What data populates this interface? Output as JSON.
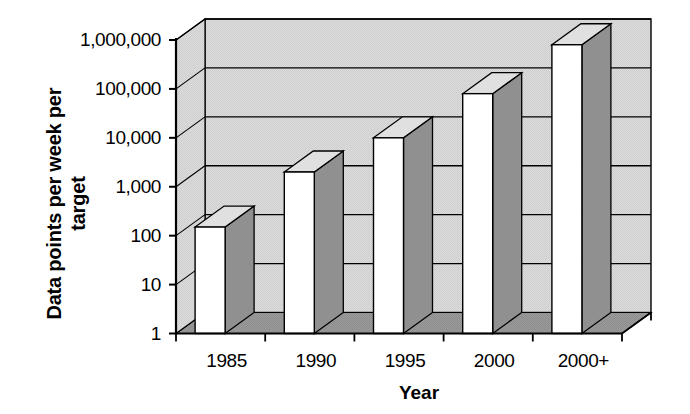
{
  "chart_data": {
    "type": "bar",
    "title": "",
    "subtitle": "",
    "xlabel": "Year",
    "ylabel": "Data points per week per target",
    "ylabel_line1": "Data points per week per",
    "ylabel_line2": "target",
    "categories": [
      "1985",
      "1990",
      "1995",
      "2000",
      "2000+"
    ],
    "values": [
      150,
      2000,
      10000,
      80000,
      800000
    ],
    "yscale": "log",
    "ylim": [
      1,
      1000000
    ],
    "ytick_labels": [
      "1",
      "10",
      "100",
      "1,000",
      "10,000",
      "100,000",
      "1,000,000"
    ],
    "ytick_values": [
      1,
      10,
      100,
      1000,
      10000,
      100000,
      1000000
    ],
    "grid": true,
    "grid_orientation": "horizontal",
    "legend": "none",
    "style": "3d-bar",
    "series": [
      {
        "name": "Data points per week per target",
        "values": [
          150,
          2000,
          10000,
          80000,
          800000
        ]
      }
    ]
  },
  "colors": {
    "bar_front": "#ffffff",
    "bar_side": "#909090",
    "bar_top": "#e0e0e0",
    "back_wall": "#d8d8d8",
    "floor": "#b0b0b0",
    "axis": "#000000",
    "text": "#000000"
  }
}
